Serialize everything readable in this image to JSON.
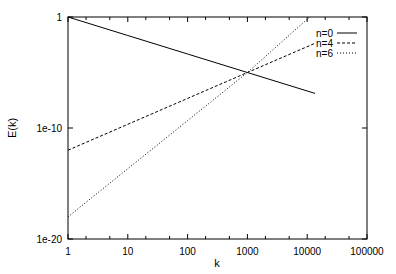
{
  "chart_data": {
    "type": "line",
    "title": "",
    "xlabel": "k",
    "ylabel": "E(k)",
    "xscale": "log",
    "yscale": "log",
    "xlim": [
      1,
      100000
    ],
    "ylim": [
      1e-20,
      1
    ],
    "grid": false,
    "legend_position": "top-right inside",
    "x_ticks": [
      1,
      10,
      100,
      1000,
      10000,
      100000
    ],
    "x_tick_labels": [
      "1",
      "10",
      "100",
      "1000",
      "10000",
      "100000"
    ],
    "y_ticks": [
      1,
      1e-10,
      1e-20
    ],
    "y_tick_labels": [
      "1",
      "1e-10",
      "1e-20"
    ],
    "series": [
      {
        "name": "n=0",
        "style": "solid",
        "x": [
          1,
          10,
          100,
          1000,
          13500
        ],
        "y": [
          1,
          0.0215,
          0.000464,
          1e-05,
          1.3e-07
        ]
      },
      {
        "name": "n=4",
        "style": "dashed",
        "x": [
          1,
          10,
          100,
          1000,
          13500
        ],
        "y": [
          1e-12,
          2.15e-10,
          4.64e-08,
          1e-05,
          0.0043
        ]
      },
      {
        "name": "n=6",
        "style": "dotted",
        "x": [
          1,
          10,
          100,
          1000,
          11000
        ],
        "y": [
          1e-18,
          2.15e-14,
          4.64e-10,
          1e-05,
          1
        ]
      }
    ]
  },
  "axes": {
    "xlabel": "k",
    "ylabel": "E(k)"
  },
  "legend": {
    "items": [
      {
        "label": "n=0",
        "style": "solid"
      },
      {
        "label": "n=4",
        "style": "dashed"
      },
      {
        "label": "n=6",
        "style": "dotted"
      }
    ]
  }
}
